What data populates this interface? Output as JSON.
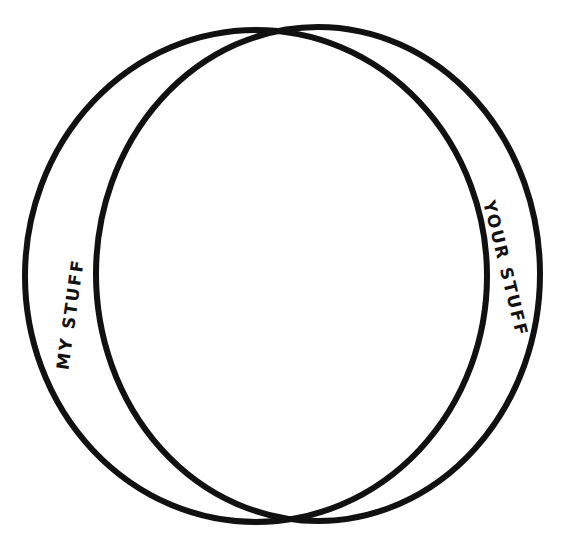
{
  "diagram": {
    "type": "venn",
    "style": "hand-drawn",
    "stroke_color": "#111111",
    "background": "#ffffff",
    "sets": [
      {
        "id": "left",
        "label": "MY STUFF"
      },
      {
        "id": "right",
        "label": "YOUR STUFF"
      }
    ],
    "overlap_label": ""
  }
}
